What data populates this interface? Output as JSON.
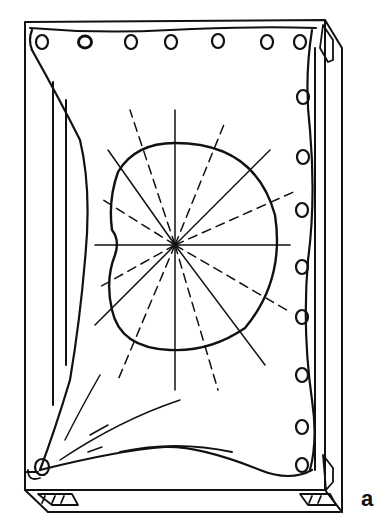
{
  "figure": {
    "panel_label": "a",
    "colors": {
      "ink": "#111111",
      "background": "#ffffff"
    },
    "top_holes_x": [
      42,
      85,
      131,
      171,
      218,
      267,
      300
    ],
    "right_holes_y": [
      97,
      157,
      210,
      267,
      317,
      375,
      427,
      465
    ],
    "center": [
      175,
      245
    ],
    "solid_ray_angles_deg": [
      0,
      40,
      90,
      135,
      180,
      220,
      270,
      320
    ],
    "dashed_ray_angles_deg": [
      20,
      60,
      75,
      110,
      155,
      200,
      250,
      290,
      340
    ]
  }
}
